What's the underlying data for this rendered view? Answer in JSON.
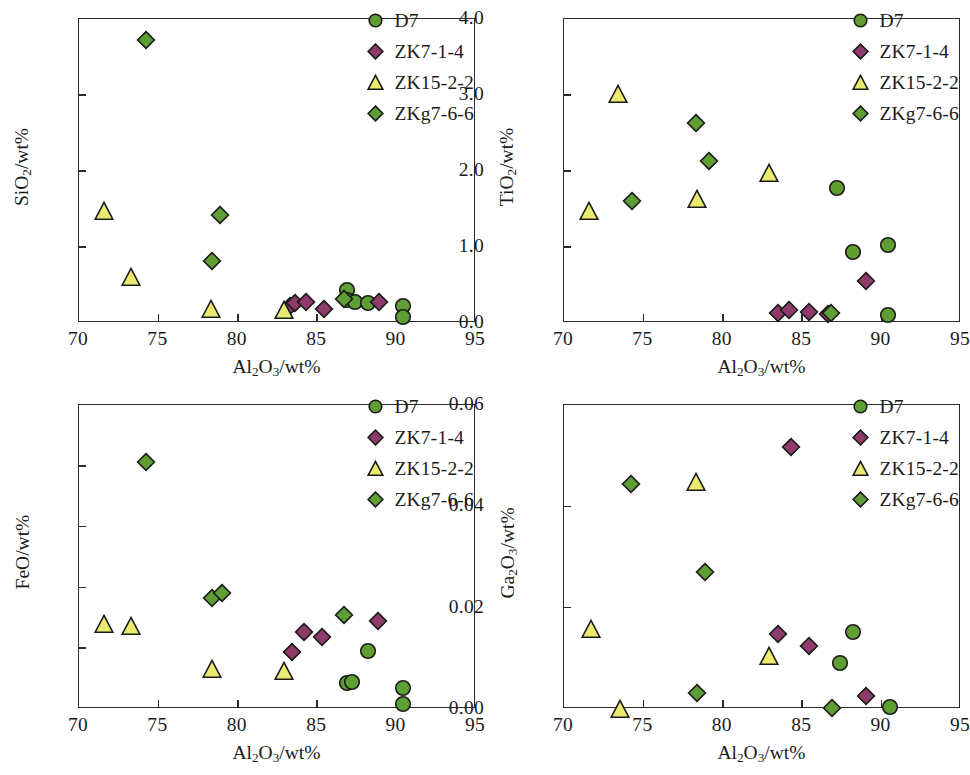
{
  "figure": {
    "panel_count": 4,
    "colors": {
      "circle_fill": "#5e9e32",
      "diamond_fill": "#8e3a6b",
      "triangle_fill": "#eaea6e",
      "diamond_green_fill": "#5e9e32",
      "marker_stroke": "#1a1a1a",
      "axis": "#2b2b2b",
      "background": "#ffffff"
    },
    "legend_labels": [
      "D7",
      "ZK7-1-4",
      "ZK15-2-2",
      "ZKg7-6-6"
    ],
    "legend_markers": [
      "circle-marker",
      "diamond-marker",
      "triangle-marker",
      "diamond-marker"
    ]
  },
  "chart_data": [
    {
      "id": "panel-sio2",
      "type": "scatter",
      "title": "",
      "xlabel": "Al2O3/wt%",
      "ylabel": "SiO2/wt%",
      "xlim": [
        70,
        95
      ],
      "ylim": [
        0.0,
        8.0
      ],
      "xticks": [
        70,
        75,
        80,
        85,
        90,
        95
      ],
      "xticklabels": [
        "70",
        "75",
        "80",
        "85",
        "90",
        "95"
      ],
      "yticks": [
        0.0,
        2.0,
        4.0,
        6.0,
        8.0
      ],
      "yticklabels": [
        "0.0",
        "2.0",
        "4.0",
        "6.0",
        "8.0"
      ],
      "grid": false,
      "legend_position": "upper right",
      "series": [
        {
          "name": "D7",
          "marker": "circle",
          "color": "#5e9e32",
          "points": [
            [
              86.9,
              0.88
            ],
            [
              86.9,
              0.6
            ],
            [
              87.4,
              0.56
            ],
            [
              88.2,
              0.52
            ],
            [
              90.4,
              0.46
            ],
            [
              90.4,
              0.16
            ]
          ]
        },
        {
          "name": "ZK7-1-4",
          "marker": "diamond",
          "color": "#8e3a6b",
          "points": [
            [
              83.3,
              0.45
            ],
            [
              83.6,
              0.52
            ],
            [
              84.3,
              0.56
            ],
            [
              85.4,
              0.36
            ],
            [
              88.9,
              0.55
            ]
          ]
        },
        {
          "name": "ZK15-2-2",
          "marker": "triangle",
          "color": "#eaea6e",
          "points": [
            [
              71.6,
              2.96
            ],
            [
              73.3,
              1.2
            ],
            [
              78.3,
              0.36
            ],
            [
              82.9,
              0.34
            ]
          ]
        },
        {
          "name": "ZKg7-6-6",
          "marker": "diamond",
          "color": "#5e9e32",
          "points": [
            [
              74.2,
              7.44
            ],
            [
              78.4,
              1.64
            ],
            [
              78.9,
              2.84
            ],
            [
              86.7,
              0.62
            ]
          ]
        }
      ]
    },
    {
      "id": "panel-tio2",
      "type": "scatter",
      "title": "",
      "xlabel": "Al2O3/wt%",
      "ylabel": "TiO2/wt%",
      "xlim": [
        70,
        95
      ],
      "ylim": [
        0.0,
        4.0
      ],
      "xticks": [
        70,
        75,
        80,
        85,
        90,
        95
      ],
      "xticklabels": [
        "70",
        "75",
        "80",
        "85",
        "90",
        "95"
      ],
      "yticks": [
        0.0,
        1.0,
        2.0,
        3.0,
        4.0
      ],
      "yticklabels": [
        "0.0",
        "1.0",
        "2.0",
        "3.0",
        "4.0"
      ],
      "grid": false,
      "legend_position": "upper right",
      "series": [
        {
          "name": "D7",
          "marker": "circle",
          "color": "#5e9e32",
          "points": [
            [
              87.2,
              1.77
            ],
            [
              88.2,
              0.94
            ],
            [
              90.4,
              1.02
            ],
            [
              90.4,
              0.1
            ]
          ]
        },
        {
          "name": "ZK7-1-4",
          "marker": "diamond",
          "color": "#8e3a6b",
          "points": [
            [
              83.5,
              0.13
            ],
            [
              84.2,
              0.17
            ],
            [
              85.4,
              0.14
            ],
            [
              86.6,
              0.12
            ],
            [
              89.0,
              0.55
            ]
          ]
        },
        {
          "name": "ZK15-2-2",
          "marker": "triangle",
          "color": "#eaea6e",
          "points": [
            [
              71.6,
              1.47
            ],
            [
              73.4,
              3.01
            ],
            [
              78.4,
              1.63
            ],
            [
              82.9,
              1.98
            ]
          ]
        },
        {
          "name": "ZKg7-6-6",
          "marker": "diamond",
          "color": "#5e9e32",
          "points": [
            [
              74.3,
              1.61
            ],
            [
              78.3,
              2.63
            ],
            [
              79.1,
              2.13
            ],
            [
              86.8,
              0.13
            ]
          ]
        }
      ]
    },
    {
      "id": "panel-feo",
      "type": "scatter",
      "title": "",
      "xlabel": "Al2O3/wt%",
      "ylabel": "FeO/wt%",
      "xlim": [
        70,
        95
      ],
      "ylim": [
        0.0,
        5.0
      ],
      "xticks": [
        70,
        75,
        80,
        85,
        90,
        95
      ],
      "xticklabels": [
        "70",
        "75",
        "80",
        "85",
        "90",
        "95"
      ],
      "yticks": [
        0.0,
        1.0,
        2.0,
        3.0,
        4.0,
        5.0
      ],
      "yticklabels": [
        "0.0",
        "1.0",
        "2.0",
        "3.0",
        "4.0",
        "5.0"
      ],
      "grid": false,
      "legend_position": "upper right",
      "series": [
        {
          "name": "D7",
          "marker": "circle",
          "color": "#5e9e32",
          "points": [
            [
              86.9,
              0.42
            ],
            [
              87.2,
              0.45
            ],
            [
              88.2,
              0.96
            ],
            [
              90.4,
              0.34
            ],
            [
              90.4,
              0.08
            ]
          ]
        },
        {
          "name": "ZK7-1-4",
          "marker": "diamond",
          "color": "#8e3a6b",
          "points": [
            [
              83.4,
              0.94
            ],
            [
              84.2,
              1.27
            ],
            [
              85.3,
              1.18
            ],
            [
              88.8,
              1.44
            ]
          ]
        },
        {
          "name": "ZK15-2-2",
          "marker": "triangle",
          "color": "#eaea6e",
          "points": [
            [
              71.6,
              1.4
            ],
            [
              73.3,
              1.37
            ],
            [
              78.4,
              0.66
            ],
            [
              82.9,
              0.63
            ]
          ]
        },
        {
          "name": "ZKg7-6-6",
          "marker": "diamond",
          "color": "#5e9e32",
          "points": [
            [
              74.2,
              4.06
            ],
            [
              78.4,
              1.82
            ],
            [
              79.0,
              1.9
            ],
            [
              86.7,
              1.54
            ]
          ]
        }
      ]
    },
    {
      "id": "panel-ga2o3",
      "type": "scatter",
      "title": "",
      "xlabel": "Al2O3/wt%",
      "ylabel": "Ga2O3/wt%",
      "xlim": [
        70,
        95
      ],
      "ylim": [
        0.0,
        0.06
      ],
      "xticks": [
        70,
        75,
        80,
        85,
        90,
        95
      ],
      "xticklabels": [
        "70",
        "75",
        "80",
        "85",
        "90",
        "95"
      ],
      "yticks": [
        0.0,
        0.02,
        0.04,
        0.06
      ],
      "yticklabels": [
        "0.00",
        "0.02",
        "0.04",
        "0.06"
      ],
      "grid": false,
      "legend_position": "upper right",
      "series": [
        {
          "name": "D7",
          "marker": "circle",
          "color": "#5e9e32",
          "points": [
            [
              87.4,
              0.009
            ],
            [
              88.2,
              0.0151
            ],
            [
              90.5,
              0.0003
            ]
          ]
        },
        {
          "name": "ZK7-1-4",
          "marker": "diamond",
          "color": "#8e3a6b",
          "points": [
            [
              83.5,
              0.0148
            ],
            [
              84.3,
              0.0517
            ],
            [
              85.4,
              0.0125
            ],
            [
              89.0,
              0.0026
            ]
          ]
        },
        {
          "name": "ZK15-2-2",
          "marker": "triangle",
          "color": "#eaea6e",
          "points": [
            [
              71.7,
              0.0157
            ],
            [
              73.5,
              0.0
            ],
            [
              78.3,
              0.0448
            ],
            [
              82.9,
              0.0104
            ]
          ]
        },
        {
          "name": "ZKg7-6-6",
          "marker": "diamond",
          "color": "#5e9e32",
          "points": [
            [
              74.2,
              0.0444
            ],
            [
              78.4,
              0.0032
            ],
            [
              78.9,
              0.027
            ],
            [
              86.9,
              0.0002
            ]
          ]
        }
      ]
    }
  ]
}
